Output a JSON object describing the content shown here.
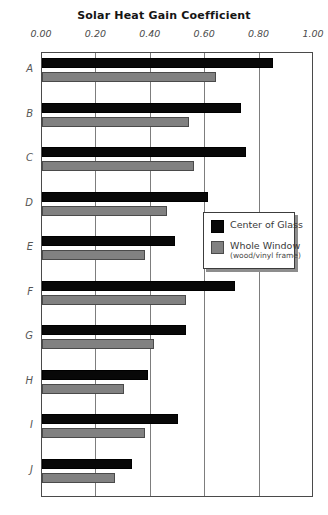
{
  "chart_data": {
    "type": "bar",
    "orientation": "horizontal",
    "title": "Solar Heat Gain Coefficient",
    "xlabel": "",
    "ylabel": "",
    "xlim": [
      0.0,
      1.0
    ],
    "xticks": [
      "0.00",
      "0.20",
      "0.40",
      "0.60",
      "0.80",
      "1.00"
    ],
    "xtick_values": [
      0.0,
      0.2,
      0.4,
      0.6,
      0.8,
      1.0
    ],
    "grid": "vertical",
    "categories": [
      "A",
      "B",
      "C",
      "D",
      "E",
      "F",
      "G",
      "H",
      "I",
      "J"
    ],
    "series": [
      {
        "name": "Center of Glass",
        "color": "#080808",
        "values": [
          0.85,
          0.73,
          0.75,
          0.61,
          0.49,
          0.71,
          0.53,
          0.39,
          0.5,
          0.33
        ]
      },
      {
        "name": "Whole Window",
        "sublabel": "(wood/vinyl frame)",
        "color": "#818181",
        "values": [
          0.64,
          0.54,
          0.56,
          0.46,
          0.38,
          0.53,
          0.41,
          0.3,
          0.38,
          0.27
        ]
      }
    ],
    "legend_position": "center-right"
  },
  "legend": {
    "series_1_label": "Center of Glass",
    "series_2_label": "Whole Window",
    "series_2_sublabel": "(wood/vinyl frame)"
  }
}
